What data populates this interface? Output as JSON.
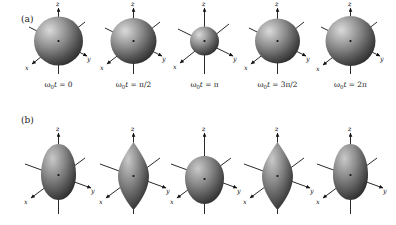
{
  "figure": {
    "caption_panels": [
      "(a)",
      "(b)"
    ],
    "background_color": "#ffffff",
    "shape_fill_dark": "#3a3a3a",
    "shape_fill_light": "#d8d8d8",
    "axis_color": "#111111"
  },
  "panels": [
    {
      "id": "a",
      "label": "(a)",
      "mode_name": "monopole breathing mode",
      "frames": [
        {
          "phase_label_prefix": "ω",
          "phase_sub": "0",
          "phase_var": "t",
          "phase_eq": "=",
          "phase_value": "0",
          "full_label": "ω0t = 0",
          "shape": "sphere",
          "radius": 24.5
        },
        {
          "phase_label_prefix": "ω",
          "phase_sub": "0",
          "phase_var": "t",
          "phase_eq": "=",
          "phase_value": "π/2",
          "full_label": "ω0t = π/2",
          "shape": "sphere",
          "radius": 23.0
        },
        {
          "phase_label_prefix": "ω",
          "phase_sub": "0",
          "phase_var": "t",
          "phase_eq": "=",
          "phase_value": "π",
          "full_label": "ω0t = π",
          "shape": "sphere",
          "radius": 14.5
        },
        {
          "phase_label_prefix": "ω",
          "phase_sub": "0",
          "phase_var": "t",
          "phase_eq": "=",
          "phase_value": "3π/2",
          "full_label": "ω0t = 3π/2",
          "shape": "sphere",
          "radius": 22.5
        },
        {
          "phase_label_prefix": "ω",
          "phase_sub": "0",
          "phase_var": "t",
          "phase_eq": "=",
          "phase_value": "2π",
          "full_label": "ω0t = 2π",
          "shape": "sphere",
          "radius": 25.0
        }
      ]
    },
    {
      "id": "b",
      "label": "(b)",
      "mode_name": "quadrupole deformation mode",
      "frames": [
        {
          "full_label": "ω0t = 0",
          "shape": "prolate-egg",
          "rx": 17.0,
          "ry": 30.0
        },
        {
          "full_label": "ω0t = π/2",
          "shape": "spindle",
          "rx": 16.0,
          "ry": 31.0
        },
        {
          "full_label": "ω0t = π",
          "shape": "oblate",
          "rx": 20.0,
          "ry": 23.0
        },
        {
          "full_label": "ω0t = 3π/2",
          "shape": "spindle",
          "rx": 16.0,
          "ry": 31.0
        },
        {
          "full_label": "ω0t = 2π",
          "shape": "prolate-egg",
          "rx": 17.0,
          "ry": 30.0
        }
      ]
    }
  ],
  "axes": {
    "z_label": "z",
    "y_label": "y",
    "x_label": "x",
    "center_dot": "•"
  },
  "chart_data": {
    "type": "line",
    "xlabel": "ω0t",
    "ylabel": "deformation amplitude",
    "x": [
      "0",
      "π/2",
      "π",
      "3π/2",
      "2π"
    ],
    "grid": false,
    "legend_position": "none",
    "series": [
      {
        "name": "(a) monopole breathing: sphere radius (px)",
        "values": [
          24.5,
          23.0,
          14.5,
          22.5,
          25.0
        ]
      },
      {
        "name": "(b) quadrupole: semi-axis along z (px)",
        "values": [
          30.0,
          31.0,
          23.0,
          31.0,
          30.0
        ]
      },
      {
        "name": "(b) quadrupole: semi-axis perpendicular to z (px)",
        "values": [
          17.0,
          16.0,
          20.0,
          16.0,
          17.0
        ]
      }
    ],
    "annotations": [
      "(a)",
      "(b)"
    ]
  }
}
